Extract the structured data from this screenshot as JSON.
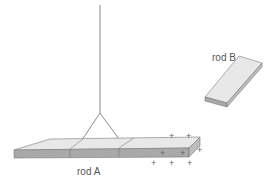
{
  "diagram": {
    "title": "",
    "colors": {
      "top_face": "#e8e8e8",
      "front_face": "#a9a9a9",
      "end_face": "#bdbdbd",
      "edge": "#7a7a7a",
      "string": "#8a8a8a"
    },
    "rod_a": {
      "label": "rod A",
      "description": "Horizontal rod suspended by a string, divided into three sections; positive charges on right end",
      "charges": [
        "+",
        "+",
        "+",
        "+",
        "+",
        "+",
        "+",
        "+"
      ]
    },
    "rod_b": {
      "label": "rod B",
      "description": "Separate tilted rod to the upper right"
    },
    "string": {
      "description": "Vertical string splitting into two supports attached to rod A"
    }
  }
}
